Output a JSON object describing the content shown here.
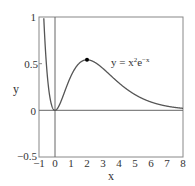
{
  "chart_data": {
    "type": "line",
    "title": "",
    "xlabel": "x",
    "ylabel": "y",
    "xlim": [
      -1,
      8
    ],
    "ylim": [
      -0.5,
      1
    ],
    "x_ticks": [
      "−1",
      "0",
      "1",
      "2",
      "3",
      "4",
      "5",
      "6",
      "7",
      "8"
    ],
    "y_ticks": [
      "−0.5",
      "0",
      "0.5",
      "1"
    ],
    "grid": false,
    "legend": null,
    "series": [
      {
        "name": "y = x²e⁻ˣ",
        "function": "x^2 * exp(-x)",
        "x": [
          -1,
          -0.8,
          -0.6,
          -0.4,
          -0.2,
          0,
          0.5,
          1,
          1.5,
          2,
          2.5,
          3,
          3.5,
          4,
          5,
          6,
          7,
          8
        ],
        "values": [
          2.718,
          1.424,
          0.656,
          0.239,
          0.049,
          0,
          0.152,
          0.368,
          0.502,
          0.541,
          0.513,
          0.448,
          0.371,
          0.293,
          0.168,
          0.089,
          0.045,
          0.021
        ]
      }
    ],
    "annotations": [
      {
        "text": "y = x²e⁻ˣ",
        "x": 4.2,
        "y": 0.53
      },
      {
        "type": "point",
        "label": "maximum",
        "x": 2,
        "y": 0.541
      }
    ],
    "reference_lines": [
      {
        "axis": "x",
        "value": 0
      },
      {
        "axis": "y",
        "value": 0
      }
    ]
  },
  "labels": {
    "xlabel": "x",
    "ylabel": "y",
    "annotation_base": "y = x",
    "annotation_sup1": "2",
    "annotation_e": "e",
    "annotation_sup2": "−x"
  },
  "ticks": {
    "x": [
      "−1",
      "0",
      "1",
      "2",
      "3",
      "4",
      "5",
      "6",
      "7",
      "8"
    ],
    "y": [
      "1",
      "0.5",
      "0",
      "−0.5"
    ]
  },
  "colors": {
    "curve": "#555555",
    "axes": "#777777",
    "text": "#333333",
    "point": "#000000"
  }
}
